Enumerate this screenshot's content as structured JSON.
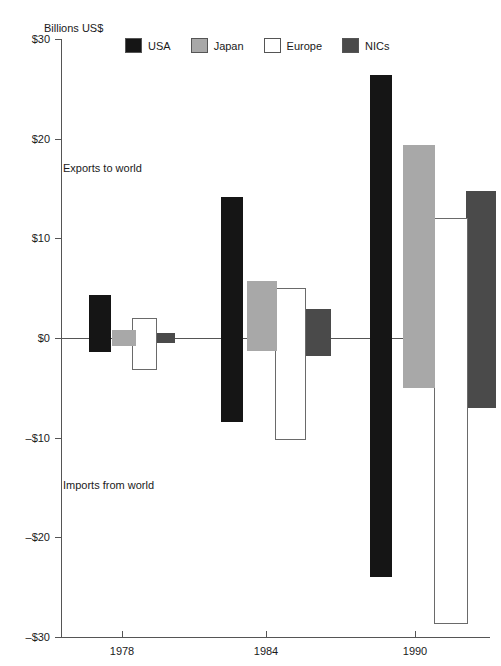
{
  "chart_data": {
    "type": "bar",
    "title": "",
    "subtitle": "",
    "unit_label": "Billions US$",
    "xlabel": "",
    "ylabel": "",
    "categories": [
      "1978",
      "1984",
      "1990"
    ],
    "ylim": [
      -30,
      30
    ],
    "yticks": [
      30,
      20,
      10,
      0,
      -10,
      -20,
      -30
    ],
    "ytick_labels": [
      "$30",
      "$20",
      "$10",
      "$0",
      "-$10",
      "-$20",
      "-$30"
    ],
    "grid": false,
    "legend_position": "top",
    "annotations": [
      {
        "text": "Exports to world",
        "note": "upper half of plot, above zero line"
      },
      {
        "text": "Imports from world",
        "note": "lower half of plot, below zero line"
      }
    ],
    "series": [
      {
        "name": "USA",
        "color": "#151515",
        "exports": [
          4.3,
          14.1,
          26.4
        ],
        "imports": [
          -1.4,
          -8.4,
          -24.0
        ]
      },
      {
        "name": "Japan",
        "color": "#a8a8a8",
        "exports": [
          0.8,
          5.7,
          19.4
        ],
        "imports": [
          -0.8,
          -1.3,
          -5.0
        ]
      },
      {
        "name": "Europe",
        "color": "#ffffff",
        "exports": [
          2.0,
          5.0,
          12.0
        ],
        "imports": [
          -3.2,
          -10.2,
          -28.7
        ]
      },
      {
        "name": "NICs",
        "color": "#4a4a4a",
        "exports": [
          0.5,
          2.9,
          14.7
        ],
        "imports": [
          -0.5,
          -1.8,
          -7.0
        ]
      }
    ]
  },
  "legend": {
    "items": [
      {
        "label": "USA",
        "color": "#151515"
      },
      {
        "label": "Japan",
        "color": "#a8a8a8"
      },
      {
        "label": "Europe",
        "color": "#ffffff"
      },
      {
        "label": "NICs",
        "color": "#4a4a4a"
      }
    ]
  }
}
